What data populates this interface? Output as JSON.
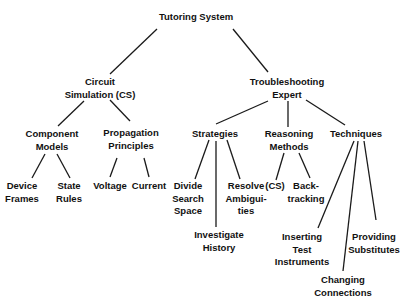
{
  "diagram": {
    "type": "tree",
    "root": {
      "label": [
        "Tutoring System"
      ],
      "children": [
        {
          "label": [
            "Circuit",
            "Simulation (CS)"
          ],
          "children": [
            {
              "label": [
                "Component",
                "Models"
              ],
              "children": [
                {
                  "label": [
                    "Device",
                    "Frames"
                  ]
                },
                {
                  "label": [
                    "State",
                    "Rules"
                  ]
                }
              ]
            },
            {
              "label": [
                "Propagation",
                "Principles"
              ],
              "children": [
                {
                  "label": [
                    "Voltage"
                  ]
                },
                {
                  "label": [
                    "Current"
                  ]
                }
              ]
            }
          ]
        },
        {
          "label": [
            "Troubleshooting",
            "Expert"
          ],
          "children": [
            {
              "label": [
                "Strategies"
              ],
              "children": [
                {
                  "label": [
                    "Divide",
                    "Search",
                    "Space"
                  ]
                },
                {
                  "label": [
                    "Investigate",
                    "History"
                  ]
                },
                {
                  "label": [
                    "Resolve",
                    "Ambigui-",
                    "ties"
                  ]
                }
              ]
            },
            {
              "label": [
                "Reasoning",
                "Methods"
              ],
              "children": [
                {
                  "label": [
                    "(CS)"
                  ]
                },
                {
                  "label": [
                    "Back-",
                    "tracking"
                  ]
                }
              ]
            },
            {
              "label": [
                "Techniques"
              ],
              "children": [
                {
                  "label": [
                    "Inserting",
                    "Test",
                    "Instruments"
                  ]
                },
                {
                  "label": [
                    "Changing",
                    "Connections"
                  ]
                },
                {
                  "label": [
                    "Providing",
                    "Substitutes"
                  ]
                }
              ]
            }
          ]
        }
      ]
    }
  },
  "nodes": {
    "tutoring_system": {
      "l1": "Tutoring System"
    },
    "circuit_simulation": {
      "l1": "Circuit",
      "l2": "Simulation (CS)"
    },
    "troubleshooting_expert": {
      "l1": "Troubleshooting",
      "l2": "Expert"
    },
    "component_models": {
      "l1": "Component",
      "l2": "Models"
    },
    "propagation_principles": {
      "l1": "Propagation",
      "l2": "Principles"
    },
    "strategies": {
      "l1": "Strategies"
    },
    "reasoning_methods": {
      "l1": "Reasoning",
      "l2": "Methods"
    },
    "techniques": {
      "l1": "Techniques"
    },
    "device_frames": {
      "l1": "Device",
      "l2": "Frames"
    },
    "state_rules": {
      "l1": "State",
      "l2": "Rules"
    },
    "voltage": {
      "l1": "Voltage"
    },
    "current": {
      "l1": "Current"
    },
    "divide_search_space": {
      "l1": "Divide",
      "l2": "Search",
      "l3": "Space"
    },
    "investigate_history": {
      "l1": "Investigate",
      "l2": "History"
    },
    "resolve_ambiguities": {
      "l1": "Resolve",
      "l2": "Ambigui-",
      "l3": "ties"
    },
    "reasoning_cs": {
      "l1": "(CS)"
    },
    "backtracking": {
      "l1": "Back-",
      "l2": "tracking"
    },
    "inserting_test_instruments": {
      "l1": "Inserting",
      "l2": "Test",
      "l3": "Instruments"
    },
    "changing_connections": {
      "l1": "Changing",
      "l2": "Connections"
    },
    "providing_substitutes": {
      "l1": "Providing",
      "l2": "Substitutes"
    }
  },
  "colors": {
    "line": "#1a1a1a",
    "text": "#111111",
    "background": "#ffffff"
  }
}
